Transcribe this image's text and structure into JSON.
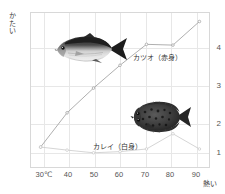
{
  "chart_data": {
    "type": "line",
    "title": "",
    "xlabel": "熱い",
    "ylabel": "かたい",
    "x": [
      30,
      40,
      50,
      60,
      70,
      80,
      90
    ],
    "xtick_labels": [
      "30℃",
      "40",
      "50",
      "60",
      "70",
      "80",
      "90"
    ],
    "ytick_labels": [
      "1",
      "2",
      "3",
      "4"
    ],
    "ytick_values": [
      1,
      2,
      3,
      4
    ],
    "ylim": [
      0.45,
      4.55
    ],
    "xlim": [
      26,
      94
    ],
    "grid": true,
    "legend_position": "inline-annotation",
    "series": [
      {
        "name": "カツオ（赤身）",
        "label": "カツオ（赤身）",
        "color": "#9a9a9a",
        "values": [
          1.0,
          1.9,
          2.55,
          3.15,
          3.7,
          3.68,
          4.3
        ]
      },
      {
        "name": "カレイ（白身）",
        "label": "カレイ（白身）",
        "color": "#c9c9c9",
        "values": [
          1.0,
          0.92,
          0.85,
          0.88,
          0.95,
          1.35,
          0.95
        ]
      }
    ],
    "annotations": [
      {
        "name": "bonito-illustration",
        "text": "カツオ",
        "x": 45,
        "y": 3.5
      },
      {
        "name": "flounder-illustration",
        "text": "カレイ",
        "x": 77,
        "y": 1.9
      }
    ]
  },
  "axes": {
    "y_title_chars": [
      "か",
      "た",
      "い"
    ],
    "x_title": "熱い"
  },
  "colors": {
    "grid": "#e7e7e7",
    "border": "#d8d8d8",
    "katsuo_line": "#9a9a9a",
    "karei_line": "#c9c9c9",
    "text": "#3a3a3a",
    "tick_text": "#555555",
    "background": "#ffffff"
  }
}
